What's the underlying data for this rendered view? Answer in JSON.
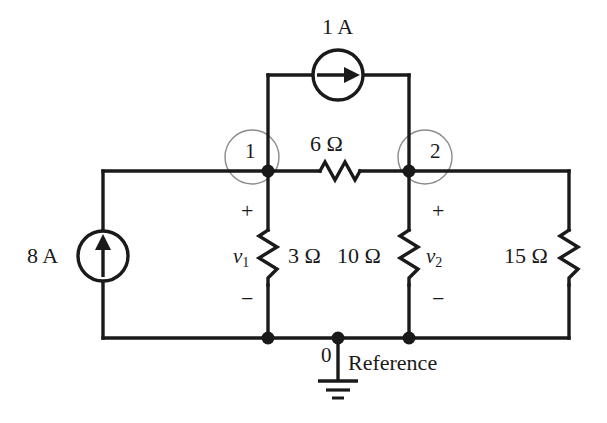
{
  "diagram": {
    "colors": {
      "wire": "#1a1a1a",
      "node_circle": "#8c8c8c",
      "text": "#1a1a1a",
      "background": "#ffffff"
    }
  },
  "sources": [
    {
      "id": "source-1a",
      "label": "1 A",
      "type": "current-source",
      "orientation": "horizontal",
      "arrow_direction": "right"
    },
    {
      "id": "source-8a",
      "label": "8 A",
      "type": "current-source",
      "orientation": "vertical",
      "arrow_direction": "up"
    }
  ],
  "resistors": [
    {
      "id": "r-6",
      "label": "6 Ω",
      "orientation": "horizontal"
    },
    {
      "id": "r-3",
      "label": "3 Ω",
      "orientation": "vertical"
    },
    {
      "id": "r-10",
      "label": "10 Ω",
      "orientation": "vertical"
    },
    {
      "id": "r-15",
      "label": "15 Ω",
      "orientation": "vertical"
    }
  ],
  "nodes": [
    {
      "id": "node-1",
      "label": "1"
    },
    {
      "id": "node-2",
      "label": "2"
    },
    {
      "id": "node-0",
      "label": "0"
    }
  ],
  "voltages": [
    {
      "id": "v1",
      "symbol": "v",
      "subscript": "1",
      "plus": "+",
      "minus": "−"
    },
    {
      "id": "v2",
      "symbol": "v",
      "subscript": "2",
      "plus": "+",
      "minus": "−"
    }
  ],
  "ground": {
    "label": "Reference",
    "node_label": "0"
  }
}
